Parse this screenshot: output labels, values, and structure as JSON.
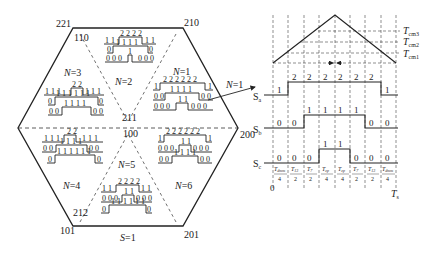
{
  "hexagon": {
    "vertices": [
      {
        "id": "top-left",
        "label": "221",
        "x": 73,
        "y": 28
      },
      {
        "id": "top-right",
        "label": "210",
        "x": 183,
        "y": 28
      },
      {
        "id": "right",
        "label": "200",
        "x": 238,
        "y": 128
      },
      {
        "id": "bottom-right",
        "label": "201",
        "x": 183,
        "y": 226
      },
      {
        "id": "bottom-left",
        "label": "101",
        "x": 73,
        "y": 226
      },
      {
        "id": "left",
        "label": "",
        "x": 18,
        "y": 128
      }
    ],
    "inner_labels": {
      "top_left_inner": "110",
      "center_upper": "211",
      "center_lower": "100",
      "bottom_left_inner": "212"
    },
    "sector_labels": [
      "N=1",
      "N=2",
      "N=3",
      "N=4",
      "N=5",
      "N=6"
    ],
    "bottom_label": "S=1",
    "arrow_label": "N=1"
  },
  "sectors": [
    {
      "name": "N=2",
      "rows": [
        [
          "1 1",
          "2 2 2 2",
          "1 1"
        ],
        [
          "0",
          "1 1 1 1",
          "0"
        ],
        [
          "0 0 0",
          "1",
          "0 0 0"
        ]
      ]
    },
    {
      "name": "N=3",
      "rows": [
        [
          "1 1 1",
          "2 2",
          "1 1 1"
        ],
        [
          "0",
          "1 1 1 1 1 1",
          "0"
        ],
        [
          "0 0",
          "1 1 1 1",
          "0 0"
        ]
      ]
    },
    {
      "name": "N=1",
      "rows": [
        [
          "1",
          "2 2 2 2 2 2",
          "1"
        ],
        [
          "0 0",
          "1 1 1 1",
          "0 0"
        ],
        [
          "0 0 0",
          "1 1",
          "0 0 0"
        ]
      ]
    },
    {
      "name": "N=4",
      "rows": [
        [
          "1 1 1",
          "2 2",
          "1 1 1"
        ],
        [
          "0 0",
          "1 1 1 1",
          "0 0"
        ],
        [
          "0",
          "1 1 1 1 1 1",
          "0"
        ]
      ]
    },
    {
      "name": "N=6",
      "rows": [
        [
          "1",
          "2 2 2 2 2 2",
          "1"
        ],
        [
          "0 0 0",
          "1 1",
          "0 0 0"
        ],
        [
          "0 0",
          "1 1 1 1",
          "0 0"
        ]
      ]
    },
    {
      "name": "N=5",
      "rows": [
        [
          "1 1",
          "2 2 2 2",
          "1 1"
        ],
        [
          "0 0 0",
          "1 1",
          "0 0 0"
        ],
        [
          "0",
          "1 1 1 1 1 1",
          "0"
        ]
      ]
    }
  ],
  "timing": {
    "carrier_levels": [
      "T_cm3",
      "T_cm2",
      "T_cm1"
    ],
    "signals": [
      {
        "name": "Sa",
        "values": [
          "1",
          "2",
          "2",
          "2",
          "2",
          "2",
          "2",
          "1"
        ]
      },
      {
        "name": "Sb",
        "values": [
          "0",
          "0",
          "1",
          "1",
          "1",
          "1",
          "0",
          "0"
        ]
      },
      {
        "name": "Sc",
        "values": [
          "0",
          "0",
          "0",
          "1",
          "1",
          "0",
          "0",
          "0"
        ]
      }
    ],
    "intervals": [
      {
        "num": "T_dmm",
        "den": "4"
      },
      {
        "num": "T_13",
        "den": "2"
      },
      {
        "num": "T_7",
        "den": "2"
      },
      {
        "num": "T_zp",
        "den": "4"
      },
      {
        "num": "T_zp",
        "den": "4"
      },
      {
        "num": "T_7",
        "den": "2"
      },
      {
        "num": "T_13",
        "den": "2"
      },
      {
        "num": "T_dmm",
        "den": "4"
      }
    ],
    "axis_start": "0",
    "axis_end": "T_s"
  },
  "text": {
    "v221": "221",
    "v210": "210",
    "v200": "200",
    "v201": "201",
    "v101": "101",
    "v110": "110",
    "v211": "211",
    "v100": "100",
    "v212": "212",
    "n1": "N",
    "n1v": "=1",
    "n2v": "=2",
    "n3v": "=3",
    "n4v": "=4",
    "n5v": "=5",
    "n6v": "=6",
    "s1": "S",
    "s1v": "=1",
    "arrowN": "N",
    "arrowNv": "=1",
    "Tcm": "T",
    "cm3": "cm3",
    "cm2": "cm2",
    "cm1": "cm1",
    "Sa": "S",
    "a": "a",
    "Sb": "S",
    "b": "b",
    "Sc": "S",
    "c": "c",
    "zero": "0",
    "Ts": "T",
    "s": "s"
  }
}
